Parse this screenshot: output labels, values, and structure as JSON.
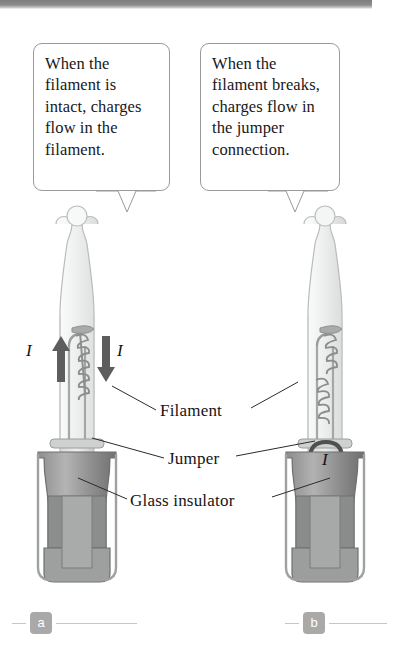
{
  "figure": {
    "callouts": [
      {
        "id": "a",
        "text": "When the filament is intact, charges flow in the filament."
      },
      {
        "id": "b",
        "text": "When the filament breaks, charges flow in the jumper connection."
      }
    ],
    "labels": {
      "filament": "Filament",
      "jumper": "Jumper",
      "glass_insulator": "Glass insulator"
    },
    "current_symbols": {
      "left_up": "I",
      "left_down": "I",
      "right_jumper": "I"
    },
    "panels": [
      {
        "badge": "a"
      },
      {
        "badge": "b"
      }
    ],
    "colors": {
      "ink": "#141416",
      "outline": "#9a9a9a",
      "glass": "#e9eaea",
      "metal_base": "#9d9d9d",
      "metal_dark": "#7c7c7c",
      "badge": "#a9a9a9",
      "arrow": "#5d5d5d"
    }
  }
}
